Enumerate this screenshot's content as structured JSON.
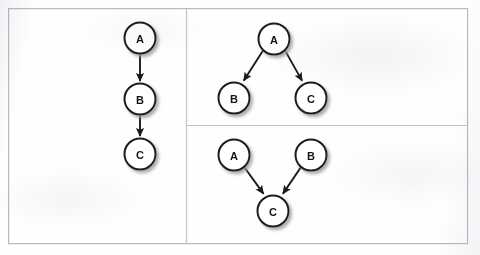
{
  "figure": {
    "name": "causal-graph-structures",
    "background_color": "#fefefe",
    "frame": {
      "name": "outer-frame",
      "x": 8,
      "y": 8,
      "width": 460,
      "height": 236,
      "stroke": "#b9bbbe",
      "stroke_width": 1.2
    },
    "dividers": [
      {
        "name": "vertical-divider",
        "orientation": "vertical",
        "x1": 186,
        "y1": 8,
        "x2": 186,
        "y2": 244,
        "stroke": "#c2c4c7"
      },
      {
        "name": "horizontal-divider",
        "orientation": "horizontal",
        "x1": 186,
        "y1": 125,
        "x2": 468,
        "y2": 125,
        "stroke": "#c2c4c7"
      }
    ],
    "style": {
      "node_radius": 15.5,
      "node_fill": "#ffffff",
      "node_stroke": "#1a1a1a",
      "node_stroke_width": 2.0,
      "label_color": "#141414",
      "edge_color": "#1a1a1a",
      "edge_width": 1.9,
      "shadow_color": "#a8a8a8"
    }
  },
  "panels": [
    {
      "name": "panel-chain",
      "structure": "chain",
      "description": "A causes B causes C",
      "nodes": [
        {
          "id": "A",
          "label": "A",
          "cx": 140,
          "cy": 38
        },
        {
          "id": "B",
          "label": "B",
          "cx": 140,
          "cy": 99
        },
        {
          "id": "C",
          "label": "C",
          "cx": 140,
          "cy": 154
        }
      ],
      "edges": [
        {
          "name": "edge-a-to-b",
          "from": "A",
          "to": "B",
          "label": "A → B"
        },
        {
          "name": "edge-b-to-c",
          "from": "B",
          "to": "C",
          "label": "B → C"
        }
      ]
    },
    {
      "name": "panel-fork",
      "structure": "fork",
      "description": "A causes both B and C",
      "nodes": [
        {
          "id": "A",
          "label": "A",
          "cx": 274,
          "cy": 39
        },
        {
          "id": "B",
          "label": "B",
          "cx": 234,
          "cy": 98
        },
        {
          "id": "C",
          "label": "C",
          "cx": 311,
          "cy": 98
        }
      ],
      "edges": [
        {
          "name": "edge-a-to-b",
          "from": "A",
          "to": "B",
          "label": "A → B"
        },
        {
          "name": "edge-a-to-c",
          "from": "A",
          "to": "C",
          "label": "A → C"
        }
      ]
    },
    {
      "name": "panel-collider",
      "structure": "collider",
      "description": "A and B both cause C",
      "nodes": [
        {
          "id": "A",
          "label": "A",
          "cx": 234,
          "cy": 155
        },
        {
          "id": "B",
          "label": "B",
          "cx": 311,
          "cy": 155
        },
        {
          "id": "C",
          "label": "C",
          "cx": 273,
          "cy": 211
        }
      ],
      "edges": [
        {
          "name": "edge-a-to-c",
          "from": "A",
          "to": "C",
          "label": "A → C"
        },
        {
          "name": "edge-b-to-c",
          "from": "B",
          "to": "C",
          "label": "B → C"
        }
      ]
    }
  ]
}
